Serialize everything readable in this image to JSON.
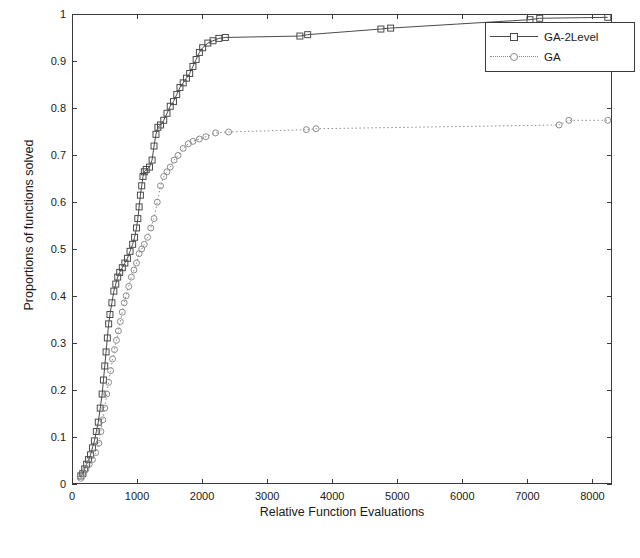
{
  "chart_data": {
    "type": "line",
    "title": "",
    "xlabel": "Relative Function Evaluations",
    "ylabel": "Proportions of functions solved",
    "xlim": [
      0,
      8300
    ],
    "ylim": [
      0,
      1
    ],
    "xticks": [
      0,
      1000,
      2000,
      3000,
      4000,
      5000,
      6000,
      7000,
      8000
    ],
    "yticks": [
      0,
      0.1,
      0.2,
      0.3,
      0.4,
      0.5,
      0.6,
      0.7,
      0.8,
      0.9,
      1
    ],
    "ytick_labels": [
      "0",
      "0.1",
      "0.2",
      "0.3",
      "0.4",
      "0.5",
      "0.6",
      "0.7",
      "0.8",
      "0.9",
      "1"
    ],
    "xtick_labels": [
      "0",
      "1000",
      "2000",
      "3000",
      "4000",
      "5000",
      "6000",
      "7000",
      "8000"
    ],
    "grid": false,
    "legend_position": "upper right",
    "series": [
      {
        "name": "GA-2Level",
        "marker": "square",
        "linestyle": "solid",
        "color": "#4a4a4a",
        "points": [
          [
            120,
            0.015
          ],
          [
            150,
            0.02
          ],
          [
            180,
            0.03
          ],
          [
            210,
            0.04
          ],
          [
            240,
            0.05
          ],
          [
            270,
            0.06
          ],
          [
            300,
            0.075
          ],
          [
            330,
            0.09
          ],
          [
            360,
            0.11
          ],
          [
            390,
            0.13
          ],
          [
            420,
            0.16
          ],
          [
            450,
            0.19
          ],
          [
            470,
            0.22
          ],
          [
            490,
            0.25
          ],
          [
            510,
            0.28
          ],
          [
            530,
            0.31
          ],
          [
            550,
            0.34
          ],
          [
            570,
            0.36
          ],
          [
            600,
            0.385
          ],
          [
            630,
            0.41
          ],
          [
            660,
            0.425
          ],
          [
            690,
            0.44
          ],
          [
            720,
            0.45
          ],
          [
            760,
            0.46
          ],
          [
            800,
            0.47
          ],
          [
            840,
            0.48
          ],
          [
            880,
            0.495
          ],
          [
            920,
            0.51
          ],
          [
            950,
            0.525
          ],
          [
            980,
            0.545
          ],
          [
            1000,
            0.565
          ],
          [
            1020,
            0.59
          ],
          [
            1040,
            0.615
          ],
          [
            1060,
            0.635
          ],
          [
            1080,
            0.655
          ],
          [
            1100,
            0.665
          ],
          [
            1130,
            0.67
          ],
          [
            1180,
            0.675
          ],
          [
            1220,
            0.69
          ],
          [
            1250,
            0.72
          ],
          [
            1280,
            0.745
          ],
          [
            1310,
            0.76
          ],
          [
            1350,
            0.765
          ],
          [
            1400,
            0.775
          ],
          [
            1450,
            0.79
          ],
          [
            1500,
            0.805
          ],
          [
            1550,
            0.815
          ],
          [
            1600,
            0.83
          ],
          [
            1650,
            0.845
          ],
          [
            1700,
            0.855
          ],
          [
            1750,
            0.865
          ],
          [
            1800,
            0.875
          ],
          [
            1850,
            0.89
          ],
          [
            1900,
            0.905
          ],
          [
            1950,
            0.92
          ],
          [
            2000,
            0.93
          ],
          [
            2080,
            0.94
          ],
          [
            2160,
            0.945
          ],
          [
            2250,
            0.95
          ],
          [
            2350,
            0.952
          ],
          [
            3500,
            0.955
          ],
          [
            3620,
            0.958
          ],
          [
            4750,
            0.97
          ],
          [
            4900,
            0.972
          ],
          [
            7050,
            0.99
          ],
          [
            7200,
            0.993
          ],
          [
            8250,
            0.995
          ]
        ]
      },
      {
        "name": "GA",
        "marker": "circle",
        "linestyle": "dotted",
        "color": "#8a8a8a",
        "points": [
          [
            120,
            0.01
          ],
          [
            160,
            0.02
          ],
          [
            200,
            0.03
          ],
          [
            250,
            0.04
          ],
          [
            300,
            0.05
          ],
          [
            350,
            0.065
          ],
          [
            400,
            0.085
          ],
          [
            430,
            0.11
          ],
          [
            460,
            0.135
          ],
          [
            490,
            0.16
          ],
          [
            520,
            0.19
          ],
          [
            550,
            0.215
          ],
          [
            580,
            0.24
          ],
          [
            610,
            0.265
          ],
          [
            640,
            0.285
          ],
          [
            670,
            0.305
          ],
          [
            700,
            0.325
          ],
          [
            730,
            0.345
          ],
          [
            760,
            0.365
          ],
          [
            790,
            0.385
          ],
          [
            820,
            0.4
          ],
          [
            860,
            0.42
          ],
          [
            900,
            0.44
          ],
          [
            940,
            0.455
          ],
          [
            980,
            0.47
          ],
          [
            1020,
            0.49
          ],
          [
            1060,
            0.5
          ],
          [
            1100,
            0.51
          ],
          [
            1150,
            0.525
          ],
          [
            1200,
            0.545
          ],
          [
            1250,
            0.565
          ],
          [
            1300,
            0.6
          ],
          [
            1350,
            0.635
          ],
          [
            1400,
            0.655
          ],
          [
            1450,
            0.665
          ],
          [
            1500,
            0.675
          ],
          [
            1560,
            0.69
          ],
          [
            1620,
            0.7
          ],
          [
            1700,
            0.715
          ],
          [
            1780,
            0.725
          ],
          [
            1850,
            0.73
          ],
          [
            1950,
            0.735
          ],
          [
            2050,
            0.74
          ],
          [
            2200,
            0.748
          ],
          [
            2400,
            0.75
          ],
          [
            3600,
            0.755
          ],
          [
            3750,
            0.757
          ],
          [
            7500,
            0.765
          ],
          [
            7650,
            0.775
          ],
          [
            8250,
            0.775
          ]
        ]
      }
    ]
  },
  "legend": {
    "items": [
      {
        "label": "GA-2Level"
      },
      {
        "label": "GA"
      }
    ]
  }
}
